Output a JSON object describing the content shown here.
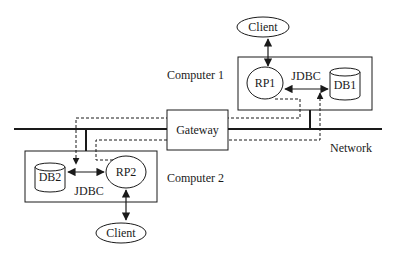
{
  "diagram": {
    "type": "distributed-system-architecture",
    "nodes": {
      "client_top": {
        "label": "Client"
      },
      "client_bottom": {
        "label": "Client"
      },
      "computer1": {
        "label": "Computer 1"
      },
      "computer2": {
        "label": "Computer 2"
      },
      "rp1": {
        "label": "RP1"
      },
      "rp2": {
        "label": "RP2"
      },
      "db1": {
        "label": "DB1"
      },
      "db2": {
        "label": "DB2"
      },
      "gateway": {
        "label": "Gateway"
      },
      "network": {
        "label": "Network"
      }
    },
    "connector_labels": {
      "jdbc1": "JDBC",
      "jdbc2": "JDBC"
    },
    "edges": [
      {
        "from": "Client",
        "to": "RP1",
        "style": "solid",
        "arrows": "both"
      },
      {
        "from": "RP1",
        "to": "DB1",
        "style": "solid",
        "arrows": "both",
        "label": "JDBC"
      },
      {
        "from": "Client",
        "to": "RP2",
        "style": "solid",
        "arrows": "both"
      },
      {
        "from": "DB2",
        "to": "RP2",
        "style": "solid",
        "arrows": "both",
        "label": "JDBC"
      },
      {
        "from": "RP1",
        "to": "DB2",
        "style": "dashed",
        "via": "Gateway",
        "arrows": "end"
      },
      {
        "from": "RP2",
        "to": "DB1",
        "style": "dashed",
        "via": "Gateway",
        "arrows": "end"
      },
      {
        "from": "Computer 1",
        "to": "Network",
        "style": "thick"
      },
      {
        "from": "Computer 2",
        "to": "Network",
        "style": "thick"
      }
    ]
  }
}
